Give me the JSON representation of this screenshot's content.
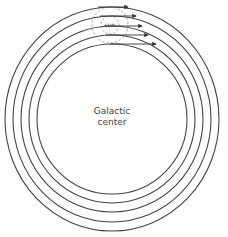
{
  "diagram": {
    "center_label_line1": "Galactic",
    "center_label_line2": "center",
    "sun_label": "sun",
    "center": {
      "x": 112,
      "y": 119
    },
    "orbits": [
      {
        "rx": 107,
        "ry": 112
      },
      {
        "rx": 99,
        "ry": 103
      },
      {
        "rx": 91,
        "ry": 93
      },
      {
        "rx": 83,
        "ry": 84
      },
      {
        "rx": 75,
        "ry": 75
      }
    ],
    "sun_neighborhood": {
      "x": 110,
      "y": 25,
      "outer_r": 18,
      "inner_r": 9
    },
    "velocity_arrows": [
      {
        "y": 7,
        "x1": 98,
        "x2": 128
      },
      {
        "y": 16,
        "x1": 100,
        "x2": 136
      },
      {
        "y": 26,
        "x1": 104,
        "x2": 142
      },
      {
        "y": 35,
        "x1": 106,
        "x2": 148
      },
      {
        "y": 44,
        "x1": 110,
        "x2": 156
      }
    ],
    "colors": {
      "line": "#444444",
      "dashed": "#888888",
      "background": "#ffffff"
    }
  }
}
